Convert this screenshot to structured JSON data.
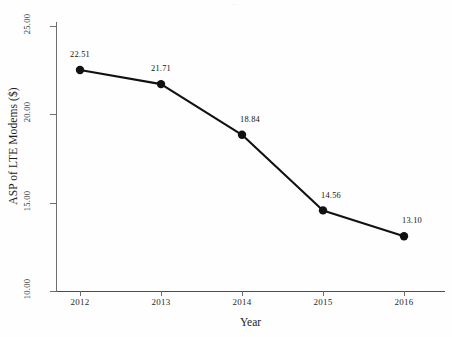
{
  "figure": {
    "title_remnant": "...",
    "background_color": "#fefefe",
    "line_color": "#111111",
    "marker_color": "#111111",
    "axis_color": "#6e6e6e",
    "text_color": "#1c1c1c"
  },
  "chart_data": {
    "type": "line",
    "title": "",
    "xlabel": "Year",
    "ylabel": "ASP of LTE Modems ($)",
    "categories": [
      "2012",
      "2013",
      "2014",
      "2015",
      "2016"
    ],
    "values": [
      22.51,
      21.71,
      18.84,
      14.56,
      13.1
    ],
    "point_labels": [
      "22.51",
      "21.71",
      "18.84",
      "14.56",
      "13.10"
    ],
    "ylim": [
      10.0,
      25.0
    ],
    "ytick_labels": [
      "25.00",
      "20.00",
      "15.00",
      "10.00"
    ],
    "ytick_values": [
      25.0,
      20.0,
      15.0,
      10.0
    ],
    "xtick_labels": [
      "2012",
      "2013",
      "2014",
      "2015",
      "2016"
    ],
    "grid": false,
    "legend": false,
    "legend_position": "none",
    "series": [
      {
        "name": "ASP of LTE Modems ($)",
        "values": [
          22.51,
          21.71,
          18.84,
          14.56,
          13.1
        ]
      }
    ]
  }
}
